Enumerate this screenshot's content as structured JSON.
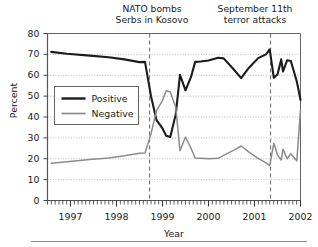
{
  "chart_data": {
    "type": "line",
    "title": "",
    "xlabel": "Year",
    "ylabel": "Percent",
    "ylim": [
      0,
      80
    ],
    "yticks": [
      0,
      10,
      20,
      30,
      40,
      50,
      60,
      70,
      80
    ],
    "xlim": [
      1996.5,
      2002.0
    ],
    "xticks": [
      1997,
      1998,
      1999,
      2000,
      2001,
      2002
    ],
    "xticklabels": [
      "1997",
      "1998",
      "1999",
      "2000",
      "2001",
      "2002"
    ],
    "grid": "horizontal-dotted",
    "legend_position": "upper-left-inside",
    "series": [
      {
        "name": "Positive",
        "color": "#1b1b1b",
        "points": [
          [
            1996.58,
            71.2
          ],
          [
            1996.92,
            70.3
          ],
          [
            1997.42,
            69.4
          ],
          [
            1997.83,
            68.6
          ],
          [
            1998.17,
            67.6
          ],
          [
            1998.5,
            66.3
          ],
          [
            1998.62,
            66.4
          ],
          [
            1998.75,
            50.0
          ],
          [
            1998.87,
            38.5
          ],
          [
            1999.0,
            34.5
          ],
          [
            1999.08,
            31.0
          ],
          [
            1999.17,
            30.4
          ],
          [
            1999.29,
            41.5
          ],
          [
            1999.38,
            60.2
          ],
          [
            1999.5,
            52.8
          ],
          [
            1999.62,
            59.2
          ],
          [
            1999.71,
            66.4
          ],
          [
            1999.83,
            66.6
          ],
          [
            2000.0,
            67.1
          ],
          [
            2000.21,
            68.4
          ],
          [
            2000.33,
            68.1
          ],
          [
            2000.54,
            63.0
          ],
          [
            2000.71,
            58.6
          ],
          [
            2000.88,
            63.6
          ],
          [
            2001.08,
            68.2
          ],
          [
            2001.25,
            70.0
          ],
          [
            2001.33,
            72.4
          ],
          [
            2001.42,
            58.8
          ],
          [
            2001.5,
            60.4
          ],
          [
            2001.58,
            67.6
          ],
          [
            2001.62,
            61.8
          ],
          [
            2001.71,
            67.2
          ],
          [
            2001.79,
            66.8
          ],
          [
            2001.92,
            57.0
          ],
          [
            2002.0,
            48.2
          ]
        ]
      },
      {
        "name": "Negative",
        "color": "#8c8c8c",
        "points": [
          [
            1996.58,
            17.8
          ],
          [
            1996.92,
            18.6
          ],
          [
            1997.42,
            19.6
          ],
          [
            1997.83,
            20.4
          ],
          [
            1998.17,
            21.4
          ],
          [
            1998.5,
            22.6
          ],
          [
            1998.62,
            22.7
          ],
          [
            1998.75,
            32.0
          ],
          [
            1998.87,
            43.0
          ],
          [
            1999.0,
            48.0
          ],
          [
            1999.08,
            52.6
          ],
          [
            1999.17,
            52.0
          ],
          [
            1999.29,
            44.5
          ],
          [
            1999.38,
            23.8
          ],
          [
            1999.5,
            30.4
          ],
          [
            1999.62,
            25.0
          ],
          [
            1999.71,
            20.3
          ],
          [
            1999.83,
            20.2
          ],
          [
            2000.0,
            20.0
          ],
          [
            2000.21,
            20.2
          ],
          [
            2000.33,
            21.6
          ],
          [
            2000.54,
            24.0
          ],
          [
            2000.71,
            26.1
          ],
          [
            2000.88,
            23.2
          ],
          [
            2001.08,
            20.2
          ],
          [
            2001.25,
            18.0
          ],
          [
            2001.33,
            16.8
          ],
          [
            2001.42,
            27.4
          ],
          [
            2001.5,
            21.8
          ],
          [
            2001.58,
            19.4
          ],
          [
            2001.62,
            24.6
          ],
          [
            2001.71,
            20.0
          ],
          [
            2001.79,
            22.4
          ],
          [
            2001.92,
            19.0
          ],
          [
            2002.0,
            43.4
          ]
        ]
      }
    ],
    "annotations": [
      {
        "id": "nato",
        "line1": "NATO bombs",
        "line2": "Serbs in Kosovo",
        "x": 1998.72
      },
      {
        "id": "sept",
        "line1": "September 11th",
        "line2": "terror attacks",
        "x": 2001.35
      }
    ]
  },
  "legend": {
    "items": [
      {
        "label": "Positive",
        "color": "#1b1b1b"
      },
      {
        "label": "Negative",
        "color": "#8c8c8c"
      }
    ]
  },
  "axes": {
    "ylabel": "Percent",
    "xlabel": "Year",
    "yticklabels": [
      "0",
      "10",
      "20",
      "30",
      "40",
      "50",
      "60",
      "70",
      "80"
    ],
    "xticklabels": [
      "1997",
      "1998",
      "1999",
      "2000",
      "2001",
      "2002"
    ]
  }
}
